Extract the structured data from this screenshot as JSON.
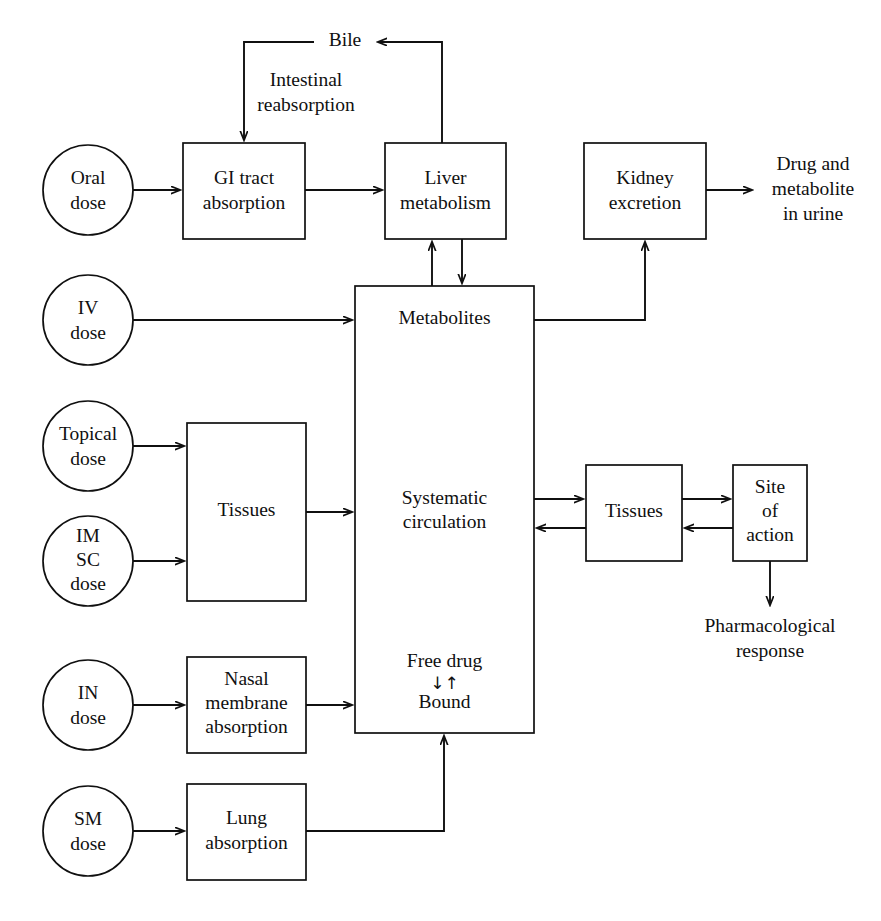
{
  "diagram": {
    "type": "flowchart",
    "background_color": "#ffffff",
    "line_color": "#101010",
    "text_color": "#101010"
  },
  "dose_circles": [
    {
      "id": "oral",
      "lines": [
        "Oral",
        "dose"
      ],
      "cx": 88,
      "cy": 190,
      "r": 45
    },
    {
      "id": "iv",
      "lines": [
        "IV",
        "dose"
      ],
      "cx": 88,
      "cy": 320,
      "r": 45
    },
    {
      "id": "topical",
      "lines": [
        "Topical",
        "dose"
      ],
      "cx": 88,
      "cy": 446,
      "r": 45
    },
    {
      "id": "im_sc",
      "lines": [
        "IM",
        "SC",
        "dose"
      ],
      "cx": 88,
      "cy": 561,
      "r": 45
    },
    {
      "id": "in",
      "lines": [
        "IN",
        "dose"
      ],
      "cx": 88,
      "cy": 705,
      "r": 45
    },
    {
      "id": "sm",
      "lines": [
        "SM",
        "dose"
      ],
      "cx": 88,
      "cy": 831,
      "r": 45
    }
  ],
  "boxes": [
    {
      "id": "gi_tract",
      "lines": [
        "GI tract",
        "absorption"
      ],
      "x": 183,
      "y": 143,
      "w": 122,
      "h": 96
    },
    {
      "id": "liver",
      "lines": [
        "Liver",
        "metabolism"
      ],
      "x": 385,
      "y": 143,
      "w": 121,
      "h": 96
    },
    {
      "id": "kidney",
      "lines": [
        "Kidney",
        "excretion"
      ],
      "x": 584,
      "y": 143,
      "w": 122,
      "h": 96
    },
    {
      "id": "tissues_left",
      "lines": [
        "Tissues"
      ],
      "x": 187,
      "y": 423,
      "w": 119,
      "h": 178
    },
    {
      "id": "nasal",
      "lines": [
        "Nasal",
        "membrane",
        "absorption"
      ],
      "x": 187,
      "y": 657,
      "w": 119,
      "h": 96
    },
    {
      "id": "lung",
      "lines": [
        "Lung",
        "absorption"
      ],
      "x": 187,
      "y": 784,
      "w": 119,
      "h": 96
    },
    {
      "id": "tissues_right",
      "lines": [
        "Tissues"
      ],
      "x": 586,
      "y": 465,
      "w": 96,
      "h": 96
    },
    {
      "id": "site_of_action",
      "lines": [
        "Site",
        "of",
        "action"
      ],
      "x": 733,
      "y": 465,
      "w": 74,
      "h": 96
    }
  ],
  "central_box": {
    "id": "systemic",
    "x": 355,
    "y": 286,
    "w": 179,
    "h": 447,
    "label_metabolites": "Metabolites",
    "label_circulation_line1": "Systematic",
    "label_circulation_line2": "circulation",
    "label_free_drug": "Free drug",
    "label_equilibrium": "↓↑",
    "label_bound": "Bound"
  },
  "free_texts": [
    {
      "id": "bile",
      "lines": [
        "Bile"
      ],
      "x": 345,
      "y": 42
    },
    {
      "id": "intestinal_reabsorption",
      "lines": [
        "Intestinal",
        "reabsorption"
      ],
      "x": 306,
      "y": 82
    },
    {
      "id": "urine_output",
      "lines": [
        "Drug and",
        "metabolite",
        "in urine"
      ],
      "x": 813,
      "y": 190
    },
    {
      "id": "pharmacological_response",
      "lines": [
        "Pharmacological",
        "response"
      ],
      "x": 770,
      "y": 639
    }
  ],
  "edges": [
    {
      "id": "oral-to-gi",
      "from": "oral",
      "to": "gi_tract",
      "arrow": true
    },
    {
      "id": "gi-to-liver",
      "from": "gi_tract",
      "to": "liver",
      "arrow": true
    },
    {
      "id": "liver-to-bile",
      "from": "liver",
      "to": "bile",
      "arrow": true
    },
    {
      "id": "bile-to-gi",
      "from": "bile",
      "to": "gi_tract",
      "arrow": true
    },
    {
      "id": "liver-to-systemic",
      "from": "liver",
      "to": "systemic",
      "arrow": true
    },
    {
      "id": "systemic-to-liver",
      "from": "systemic",
      "to": "liver",
      "arrow": true
    },
    {
      "id": "iv-to-systemic",
      "from": "iv",
      "to": "systemic",
      "arrow": true
    },
    {
      "id": "systemic-to-kidney",
      "from": "systemic",
      "to": "kidney",
      "arrow": true
    },
    {
      "id": "kidney-to-urine",
      "from": "kidney",
      "to": "urine_output",
      "arrow": true
    },
    {
      "id": "topical-to-tissues",
      "from": "topical",
      "to": "tissues_left",
      "arrow": true
    },
    {
      "id": "imsc-to-tissues",
      "from": "im_sc",
      "to": "tissues_left",
      "arrow": true
    },
    {
      "id": "tissues-to-systemic",
      "from": "tissues_left",
      "to": "systemic",
      "arrow": true
    },
    {
      "id": "systemic-to-tissuesr",
      "from": "systemic",
      "to": "tissues_right",
      "arrow": true
    },
    {
      "id": "tissuesr-to-systemic",
      "from": "tissues_right",
      "to": "systemic",
      "arrow": true
    },
    {
      "id": "tissuesr-to-site",
      "from": "tissues_right",
      "to": "site_of_action",
      "arrow": true
    },
    {
      "id": "site-to-tissuesr",
      "from": "site_of_action",
      "to": "tissues_right",
      "arrow": true
    },
    {
      "id": "site-to-response",
      "from": "site_of_action",
      "to": "pharmacological_response",
      "arrow": true
    },
    {
      "id": "in-to-nasal",
      "from": "in",
      "to": "nasal",
      "arrow": true
    },
    {
      "id": "nasal-to-systemic",
      "from": "nasal",
      "to": "systemic",
      "arrow": true
    },
    {
      "id": "sm-to-lung",
      "from": "sm",
      "to": "lung",
      "arrow": true
    },
    {
      "id": "lung-to-systemic",
      "from": "lung",
      "to": "systemic",
      "arrow": true
    }
  ]
}
